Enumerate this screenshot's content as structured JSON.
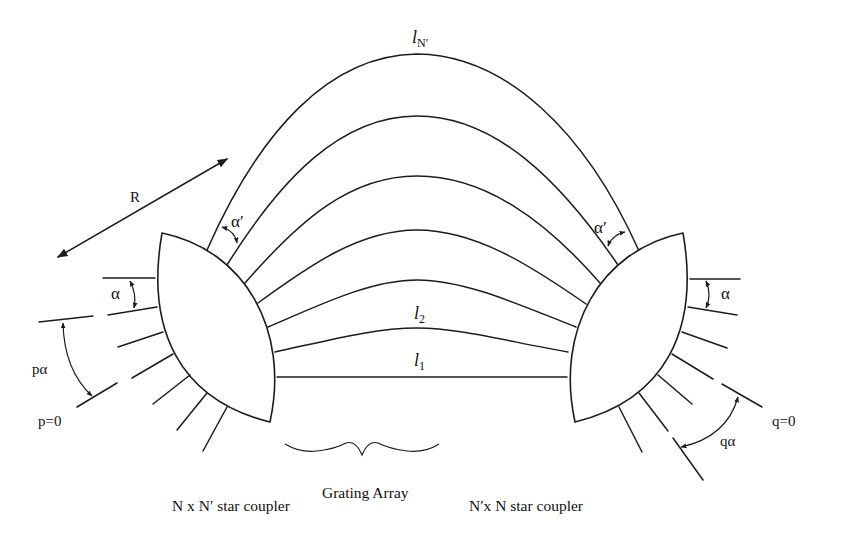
{
  "diagram": {
    "labels": {
      "radius": "R",
      "alpha_left": "α",
      "alpha_right": "α",
      "alpha_prime_left": "α′",
      "alpha_prime_right": "α′",
      "p_alpha": "pα",
      "p_zero": "p=0",
      "q_alpha": "qα",
      "q_zero": "q=0"
    },
    "waveguide_lengths": [
      {
        "symbol": "l",
        "subscript": "1"
      },
      {
        "symbol": "l",
        "subscript": "2"
      },
      {
        "symbol": "l",
        "subscript": "N′"
      }
    ],
    "captions": {
      "left_coupler": "N x N′ star coupler",
      "grating_array": "Grating Array",
      "right_coupler": "N′x N star coupler"
    }
  }
}
